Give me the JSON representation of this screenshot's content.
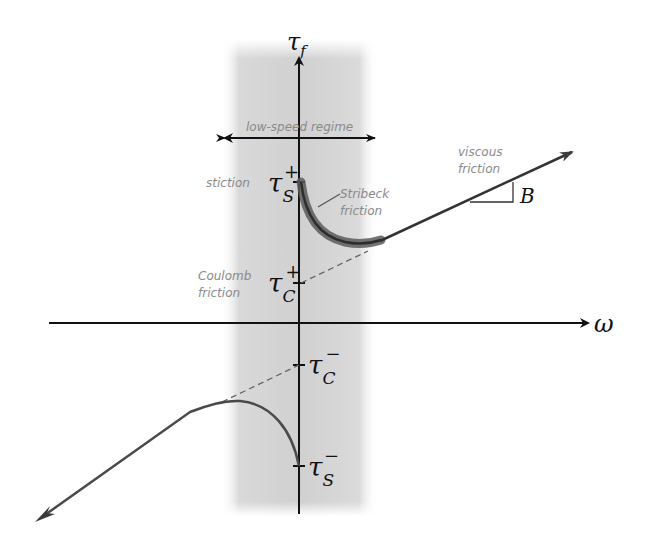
{
  "diagram": {
    "axes": {
      "y_label": "τ",
      "y_label_sub": "f",
      "x_label": "ω"
    },
    "region": {
      "label": "low-speed regime"
    },
    "ticks": {
      "tau_s_plus": {
        "main": "τ",
        "sub": "S",
        "sup": "+"
      },
      "tau_c_plus": {
        "main": "τ",
        "sub": "C",
        "sup": "+"
      },
      "tau_c_minus": {
        "main": "τ",
        "sub": "C",
        "sup": "−"
      },
      "tau_s_minus": {
        "main": "τ",
        "sub": "S",
        "sup": "−"
      }
    },
    "annotations": {
      "stiction": "stiction",
      "stribeck_line1": "Stribeck",
      "stribeck_line2": "friction",
      "viscous_line1": "viscous",
      "viscous_line2": "friction",
      "coulomb_line1": "Coulomb",
      "coulomb_line2": "friction",
      "slope_label": "B"
    },
    "colors": {
      "axis": "#111111",
      "curve": "#4a4a4a",
      "stribeck_highlight": "#5a5a5a",
      "band": "#d6d6d6",
      "annotation": "#8a8a8a",
      "dashed": "#666666"
    }
  }
}
